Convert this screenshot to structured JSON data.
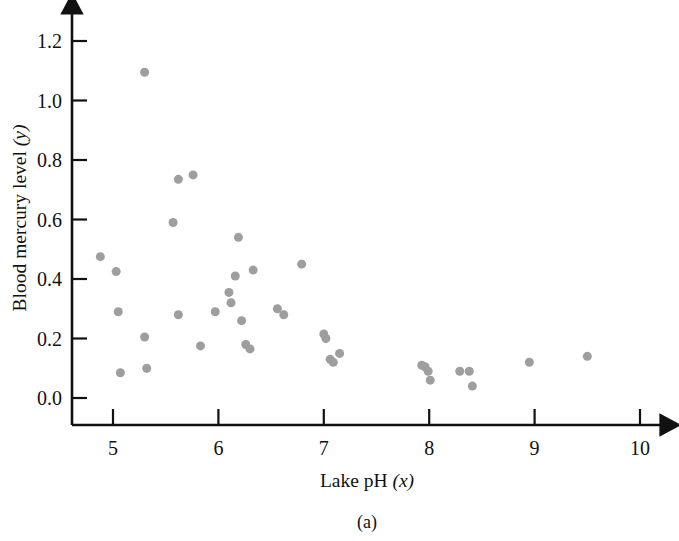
{
  "figure": {
    "caption": "(a)",
    "point_color": "#9e9e9e",
    "axis_color": "#111111",
    "background": "#ffffff"
  },
  "chart_data": {
    "type": "scatter",
    "title": "",
    "xlabel": "Lake pH (x)",
    "xlabel_text": "Lake pH ",
    "xlabel_var": "(x)",
    "ylabel": "Blood mercury level (y)",
    "ylabel_text": "Blood mercury level ",
    "ylabel_var": "(y)",
    "xlim": [
      4.55,
      10.4
    ],
    "ylim": [
      -0.07,
      1.28
    ],
    "xticks": [
      5,
      6,
      7,
      8,
      9,
      10
    ],
    "xtick_labels": [
      "5",
      "6",
      "7",
      "8",
      "9",
      "10"
    ],
    "yticks": [
      0.0,
      0.2,
      0.4,
      0.6,
      0.8,
      1.0,
      1.2
    ],
    "ytick_labels": [
      "0.0",
      "0.2",
      "0.4",
      "0.6",
      "0.8",
      "1.0",
      "1.2"
    ],
    "grid": false,
    "legend": null,
    "marker": "circle",
    "marker_size": 8,
    "x": [
      4.88,
      5.03,
      5.05,
      5.07,
      5.3,
      5.3,
      5.32,
      5.57,
      5.62,
      5.76,
      5.62,
      5.83,
      5.97,
      6.1,
      6.12,
      6.16,
      6.19,
      6.22,
      6.26,
      6.3,
      6.33,
      6.56,
      6.62,
      6.79,
      7.0,
      7.02,
      7.06,
      7.09,
      7.15,
      7.93,
      7.96,
      7.99,
      8.01,
      8.29,
      8.38,
      8.41,
      8.95,
      9.5
    ],
    "y": [
      0.475,
      0.425,
      0.29,
      0.085,
      1.095,
      0.205,
      0.1,
      0.59,
      0.735,
      0.75,
      0.28,
      0.175,
      0.29,
      0.355,
      0.32,
      0.41,
      0.54,
      0.26,
      0.18,
      0.165,
      0.43,
      0.3,
      0.28,
      0.45,
      0.215,
      0.2,
      0.13,
      0.12,
      0.15,
      0.11,
      0.105,
      0.09,
      0.06,
      0.09,
      0.09,
      0.04,
      0.12,
      0.14
    ],
    "n_points": 38
  }
}
